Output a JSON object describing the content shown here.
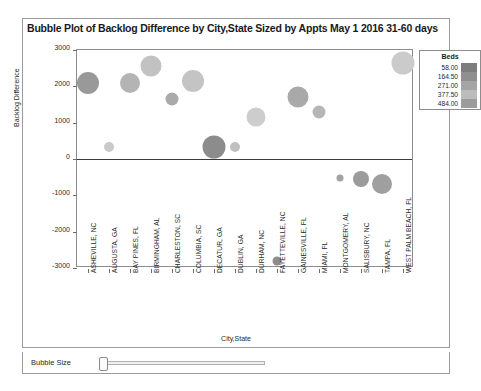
{
  "chart_data": {
    "type": "scatter",
    "title": "Bubble Plot of Backlog Difference by City,State Sized by Appts May 1 2016 31-60 days",
    "xlabel": "City,State",
    "ylabel": "Backlog Difference",
    "ylim": [
      -3000,
      3000
    ],
    "yticks": [
      "3000",
      "2000",
      "1000",
      "0",
      "-1000",
      "-2000",
      "-3000"
    ],
    "ytick_values": [
      3000,
      2000,
      1000,
      0,
      -1000,
      -2000,
      -3000
    ],
    "grid": false,
    "legend_position": "top-right",
    "categories": [
      "ASHEVILLE, NC",
      "AUGUSTA, GA",
      "BAY PINES, FL",
      "BIRMINGHAM, AL",
      "CHARLESTON, SC",
      "COLUMBIA, SC",
      "DECATUR, GA",
      "DUBLIN, GA",
      "DURHAM, NC",
      "FAYETTEVILLE, NC",
      "GAINESVILLE, FL",
      "MIAMI, FL",
      "MONTGOMERY, AL",
      "SALISBURY, NC",
      "TAMPA, FL",
      "WEST PALM BEACH, FL"
    ],
    "points": [
      {
        "category": "ASHEVILLE, NC",
        "value": 2100,
        "size": 11.0,
        "color": "#999999"
      },
      {
        "category": "AUGUSTA, GA",
        "value": 340,
        "size": 5.0,
        "color": "#c9c9c9"
      },
      {
        "category": "BAY PINES, FL",
        "value": 2090,
        "size": 10.0,
        "color": "#b4b4b4"
      },
      {
        "category": "BIRMINGHAM, AL",
        "value": 2560,
        "size": 10.5,
        "color": "#c2c2c2"
      },
      {
        "category": "CHARLESTON, SC",
        "value": 1650,
        "size": 6.5,
        "color": "#aaaaaa"
      },
      {
        "category": "COLUMBIA, SC",
        "value": 2150,
        "size": 11.0,
        "color": "#c4c4c4"
      },
      {
        "category": "DECATUR, GA",
        "value": 330,
        "size": 11.5,
        "color": "#8c8c8c"
      },
      {
        "category": "DUBLIN, GA",
        "value": 330,
        "size": 5.0,
        "color": "#c0c0c0"
      },
      {
        "category": "DURHAM, NC",
        "value": 1150,
        "size": 9.5,
        "color": "#cdcdcd"
      },
      {
        "category": "FAYETTEVILLE, NC",
        "value": -2810,
        "size": 4.5,
        "color": "#8d8d8d"
      },
      {
        "category": "GAINESVILLE, FL",
        "value": 1700,
        "size": 10.5,
        "color": "#a9a9a9"
      },
      {
        "category": "MIAMI, FL",
        "value": 1300,
        "size": 6.5,
        "color": "#b6b6b6"
      },
      {
        "category": "MONTGOMERY, AL",
        "value": -520,
        "size": 3.5,
        "color": "#a3a3a3"
      },
      {
        "category": "SALISBURY, NC",
        "value": -540,
        "size": 8.0,
        "color": "#9b9b9b"
      },
      {
        "category": "TAMPA, FL",
        "value": -700,
        "size": 10.0,
        "color": "#9f9f9f"
      },
      {
        "category": "WEST PALM BEACH, FL",
        "value": 2650,
        "size": 11.5,
        "color": "#cbcbcb"
      }
    ],
    "legend": {
      "title": "Beds",
      "entries": [
        {
          "value": "58.00",
          "color": "#7d7d7d"
        },
        {
          "value": "164.50",
          "color": "#8f8f8f"
        },
        {
          "value": "271.00",
          "color": "#a5a5a5"
        },
        {
          "value": "377.50",
          "color": "#bcbcbc"
        },
        {
          "value": "484.00",
          "color": "#9c9c9c"
        }
      ]
    }
  },
  "controls": {
    "bubble_size_label": "Bubble Size",
    "bubble_size_value": 0
  }
}
